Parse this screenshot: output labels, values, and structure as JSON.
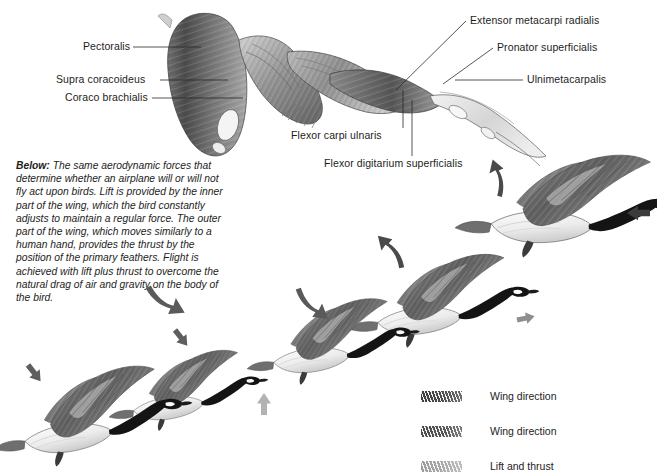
{
  "figure": {
    "type": "scientific-illustration",
    "background_color": "#ffffff",
    "ink_color": "#1d1d1b"
  },
  "anatomy": {
    "title_note": "Dissected bird wing showing flight musculature",
    "labels": [
      {
        "id": "pectoralis",
        "text": "Pectoralis",
        "side": "left",
        "x": 83,
        "y": 44,
        "leader_to_x": 200,
        "leader_to_y": 48
      },
      {
        "id": "supra-coracoideus",
        "text": "Supra coracoideus",
        "side": "left",
        "x": 56,
        "y": 76,
        "leader_to_x": 222,
        "leader_to_y": 80
      },
      {
        "id": "coraco-brachialis",
        "text": "Coraco brachialis",
        "side": "left",
        "x": 65,
        "y": 95,
        "leader_to_x": 238,
        "leader_to_y": 98
      },
      {
        "id": "extensor-metacarpi-radialis",
        "text": "Extensor metacarpi radialis",
        "side": "right",
        "x": 470,
        "y": 19,
        "leader_to_x": 398,
        "leader_to_y": 88
      },
      {
        "id": "pronator-superficialis",
        "text": "Pronator superficialis",
        "side": "right",
        "x": 497,
        "y": 45,
        "leader_to_x": 418,
        "leader_to_y": 92
      },
      {
        "id": "ulnimetacarpalis",
        "text": "Ulnimetacarpalis",
        "side": "right",
        "x": 527,
        "y": 78,
        "leader_to_x": 452,
        "leader_to_y": 82
      },
      {
        "id": "flexor-carpi-ulnaris",
        "text": "Flexor carpi ulnaris",
        "side": "below",
        "x": 291,
        "y": 133,
        "leader_to_x": 382,
        "leader_to_y": 88
      },
      {
        "id": "flexor-digitarium-superficialis",
        "text": "Flexor digitarium superficialis",
        "side": "below",
        "x": 324,
        "y": 161,
        "leader_to_x": 392,
        "leader_to_y": 96
      }
    ]
  },
  "caption": {
    "lead": "Below:",
    "body": " The same aerodynamic forces that determine whether an airplane will or will not fly act upon birds. Lift is provided by the inner part of the wing, which the bird constantly adjusts to maintain a regular force. The outer part of the wing, which moves similarly to a human hand, provides the thrust by the position of the primary feathers. Flight is achieved with lift plus thrust to overcome the natural drag of air and gravity on the body of the bird."
  },
  "flight_sequence": {
    "species": "Canada goose",
    "description": "Five geese in an ascending left-to-right wingbeat sequence",
    "birds": [
      {
        "id": "goose-1",
        "x": 20,
        "y": 360,
        "scale": 1.0,
        "wing_phase": "upstroke-high"
      },
      {
        "id": "goose-2",
        "x": 125,
        "y": 350,
        "scale": 0.92,
        "wing_phase": "downstroke"
      },
      {
        "id": "goose-3",
        "x": 262,
        "y": 300,
        "scale": 1.0,
        "wing_phase": "mid-downstroke"
      },
      {
        "id": "goose-4",
        "x": 380,
        "y": 258,
        "scale": 1.02,
        "wing_phase": "mid-upstroke"
      },
      {
        "id": "goose-5",
        "x": 500,
        "y": 190,
        "scale": 1.08,
        "wing_phase": "upstroke-peak"
      }
    ],
    "arrows": [
      {
        "id": "arrow-down-1",
        "kind": "wing-direction",
        "shape": "straight",
        "direction": "down-right",
        "x": 30,
        "y": 366
      },
      {
        "id": "arrow-curve-1",
        "kind": "wing-direction",
        "shape": "curved",
        "direction": "down",
        "x": 150,
        "y": 290
      },
      {
        "id": "arrow-down-2",
        "kind": "wing-direction",
        "shape": "straight",
        "direction": "down-right",
        "x": 172,
        "y": 330
      },
      {
        "id": "arrow-lift-1",
        "kind": "lift-and-thrust",
        "shape": "straight",
        "direction": "up",
        "x": 258,
        "y": 388
      },
      {
        "id": "arrow-curve-2",
        "kind": "wing-direction",
        "shape": "curved",
        "direction": "down",
        "x": 296,
        "y": 286
      },
      {
        "id": "arrow-up-1",
        "kind": "wing-direction",
        "shape": "curved",
        "direction": "up",
        "x": 394,
        "y": 246
      },
      {
        "id": "arrow-right-1",
        "kind": "lift-and-thrust",
        "shape": "straight",
        "direction": "right",
        "x": 520,
        "y": 320
      },
      {
        "id": "arrow-up-2",
        "kind": "wing-direction",
        "shape": "curved",
        "direction": "up-right",
        "x": 480,
        "y": 182
      },
      {
        "id": "arrow-left-1",
        "kind": "wing-direction",
        "shape": "straight",
        "direction": "left",
        "x": 624,
        "y": 213
      }
    ]
  },
  "legend": {
    "entries": [
      {
        "id": "legend-wing-direction-1",
        "label": "Wing direction",
        "swatch": "hatch-dark",
        "color": "#4a4a4a"
      },
      {
        "id": "legend-wing-direction-2",
        "label": "Wing direction",
        "swatch": "hatch-mid",
        "color": "#565656"
      },
      {
        "id": "legend-lift-and-thrust",
        "label": "Lift and thrust",
        "swatch": "hatch-light",
        "color": "#a8a8a8"
      }
    ]
  }
}
